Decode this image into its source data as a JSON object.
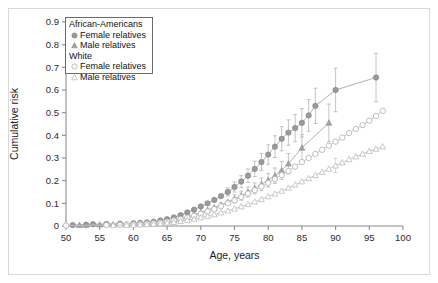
{
  "figure": {
    "background": "#ffffff",
    "frame_color": "#d9d9d9"
  },
  "chart_data": {
    "type": "line",
    "title": "",
    "xlabel": "Age, years",
    "ylabel": "Cumulative risk",
    "xlim": [
      50,
      100
    ],
    "ylim": [
      0,
      0.9
    ],
    "xticks": [
      50,
      55,
      60,
      65,
      70,
      75,
      80,
      85,
      90,
      95,
      100
    ],
    "xtick_labels": [
      "50",
      "55",
      "60",
      "65",
      "70",
      "75",
      "80",
      "85",
      "90",
      "95",
      "100"
    ],
    "yticks": [
      0,
      0.1,
      0.2,
      0.3,
      0.4,
      0.5,
      0.6,
      0.7,
      0.8,
      0.9
    ],
    "ytick_labels": [
      "0",
      "0.1",
      "0.2",
      "0.3",
      "0.4",
      "0.5",
      "0.6",
      "0.7",
      "0.8",
      "0.9"
    ],
    "grid": false,
    "legend_position": "upper-left-inside",
    "series": [
      {
        "name": "African-Americans Female relatives",
        "group": "African-Americans",
        "marker": "filled-circle",
        "color": "#9a9a9a",
        "x": [
          51,
          53,
          54,
          56,
          58,
          60,
          61,
          62,
          63,
          64,
          65,
          66,
          67,
          68,
          69,
          70,
          71,
          72,
          73,
          74,
          75,
          76,
          77,
          78,
          79,
          80,
          81,
          82,
          83,
          84,
          85,
          86,
          87,
          90,
          96
        ],
        "y": [
          0.004,
          0.006,
          0.008,
          0.009,
          0.01,
          0.012,
          0.014,
          0.016,
          0.019,
          0.024,
          0.03,
          0.038,
          0.048,
          0.06,
          0.072,
          0.086,
          0.1,
          0.115,
          0.132,
          0.15,
          0.172,
          0.196,
          0.222,
          0.252,
          0.282,
          0.315,
          0.35,
          0.385,
          0.412,
          0.432,
          0.455,
          0.488,
          0.53,
          0.6,
          0.655
        ],
        "err_low": [
          null,
          null,
          null,
          null,
          null,
          null,
          null,
          null,
          null,
          null,
          null,
          null,
          null,
          null,
          null,
          null,
          null,
          null,
          null,
          0.132,
          0.15,
          0.17,
          0.192,
          0.218,
          0.244,
          0.272,
          0.302,
          0.332,
          0.356,
          0.372,
          0.392,
          0.418,
          0.452,
          0.504,
          0.548
        ],
        "err_high": [
          null,
          null,
          null,
          null,
          null,
          null,
          null,
          null,
          null,
          null,
          null,
          null,
          null,
          null,
          null,
          null,
          null,
          null,
          null,
          0.168,
          0.194,
          0.222,
          0.252,
          0.286,
          0.32,
          0.358,
          0.398,
          0.438,
          0.468,
          0.492,
          0.518,
          0.558,
          0.608,
          0.696,
          0.762
        ]
      },
      {
        "name": "African-Americans Male relatives",
        "group": "African-Americans",
        "marker": "filled-triangle",
        "color": "#a5a5a5",
        "x": [
          52,
          53,
          55,
          57,
          59,
          61,
          63,
          64,
          65,
          66,
          67,
          68,
          69,
          70,
          71,
          72,
          73,
          74,
          75,
          76,
          77,
          78,
          79,
          80,
          81,
          82,
          83,
          85,
          89
        ],
        "y": [
          0.004,
          0.005,
          0.006,
          0.007,
          0.008,
          0.01,
          0.013,
          0.016,
          0.02,
          0.026,
          0.033,
          0.041,
          0.05,
          0.06,
          0.071,
          0.082,
          0.094,
          0.106,
          0.12,
          0.134,
          0.15,
          0.166,
          0.184,
          0.202,
          0.222,
          0.245,
          0.275,
          0.345,
          0.455
        ],
        "err_low": [
          null,
          null,
          null,
          null,
          null,
          null,
          null,
          null,
          null,
          null,
          null,
          null,
          null,
          null,
          null,
          null,
          null,
          null,
          0.102,
          0.114,
          0.128,
          0.142,
          0.156,
          0.172,
          0.188,
          0.206,
          0.23,
          0.286,
          0.372
        ],
        "err_high": [
          null,
          null,
          null,
          null,
          null,
          null,
          null,
          null,
          null,
          null,
          null,
          null,
          null,
          null,
          null,
          null,
          null,
          null,
          0.138,
          0.154,
          0.172,
          0.19,
          0.212,
          0.232,
          0.256,
          0.284,
          0.32,
          0.404,
          0.538
        ]
      },
      {
        "name": "White Female relatives",
        "group": "White",
        "marker": "open-circle",
        "color": "#b4b4b4",
        "x": [
          50,
          56,
          58,
          59,
          60,
          61,
          62,
          63,
          64,
          65,
          66,
          67,
          68,
          69,
          70,
          71,
          72,
          73,
          74,
          75,
          76,
          77,
          78,
          79,
          80,
          81,
          82,
          83,
          84,
          85,
          86,
          87,
          88,
          89,
          90,
          91,
          92,
          93,
          94,
          95,
          96,
          97
        ],
        "y": [
          0.002,
          0.004,
          0.005,
          0.006,
          0.007,
          0.008,
          0.01,
          0.012,
          0.015,
          0.019,
          0.024,
          0.03,
          0.037,
          0.045,
          0.054,
          0.064,
          0.075,
          0.087,
          0.1,
          0.114,
          0.128,
          0.143,
          0.158,
          0.174,
          0.19,
          0.207,
          0.225,
          0.243,
          0.262,
          0.282,
          0.3,
          0.318,
          0.336,
          0.354,
          0.372,
          0.39,
          0.41,
          0.428,
          0.445,
          0.465,
          0.485,
          0.508
        ],
        "err_low": [
          null,
          null,
          null,
          null,
          null,
          null,
          null,
          null,
          null,
          null,
          null,
          null,
          null,
          null,
          null,
          null,
          null,
          null,
          null,
          null,
          null,
          null,
          null,
          null,
          null,
          null,
          null,
          null,
          null,
          null,
          null,
          null,
          null,
          null,
          null,
          null,
          null,
          null,
          null,
          null,
          null,
          null
        ],
        "err_high": [
          null,
          null,
          null,
          null,
          null,
          null,
          null,
          null,
          null,
          null,
          null,
          null,
          null,
          null,
          null,
          null,
          null,
          null,
          null,
          null,
          null,
          null,
          null,
          null,
          null,
          null,
          null,
          null,
          null,
          null,
          null,
          null,
          null,
          null,
          null,
          null,
          null,
          null,
          null,
          null,
          null,
          null
        ]
      },
      {
        "name": "White Male relatives",
        "group": "White",
        "marker": "open-triangle",
        "color": "#bfbfbf",
        "x": [
          57,
          59,
          60,
          61,
          62,
          63,
          64,
          65,
          66,
          67,
          68,
          69,
          70,
          71,
          72,
          73,
          74,
          75,
          76,
          77,
          78,
          79,
          80,
          81,
          82,
          83,
          84,
          85,
          86,
          87,
          88,
          89,
          90,
          91,
          92,
          93,
          94,
          95,
          96,
          97
        ],
        "y": [
          0.003,
          0.004,
          0.005,
          0.006,
          0.007,
          0.009,
          0.011,
          0.014,
          0.017,
          0.021,
          0.026,
          0.031,
          0.037,
          0.044,
          0.051,
          0.059,
          0.067,
          0.076,
          0.086,
          0.096,
          0.107,
          0.118,
          0.13,
          0.142,
          0.155,
          0.168,
          0.182,
          0.196,
          0.21,
          0.224,
          0.238,
          0.252,
          0.266,
          0.28,
          0.294,
          0.306,
          0.318,
          0.33,
          0.34,
          0.35
        ],
        "err_low": [
          null,
          null,
          null,
          null,
          null,
          null,
          null,
          null,
          null,
          null,
          null,
          null,
          null,
          null,
          null,
          null,
          null,
          null,
          null,
          null,
          null,
          null,
          null,
          null,
          null,
          null,
          null,
          null,
          null,
          null,
          null,
          null,
          0.236,
          null,
          null,
          null,
          null,
          null,
          null,
          null
        ],
        "err_high": [
          null,
          null,
          null,
          null,
          null,
          null,
          null,
          null,
          null,
          null,
          null,
          null,
          null,
          null,
          null,
          null,
          null,
          null,
          null,
          null,
          null,
          null,
          null,
          null,
          null,
          null,
          null,
          null,
          null,
          null,
          null,
          null,
          0.298,
          null,
          null,
          null,
          null,
          null,
          null,
          null
        ]
      }
    ]
  },
  "legend": {
    "group_african": "African-Americans",
    "african_female": "Female relatives",
    "african_male": "Male relatives",
    "group_white": "White",
    "white_female": "Female relatives",
    "white_male": "Male relatives"
  }
}
